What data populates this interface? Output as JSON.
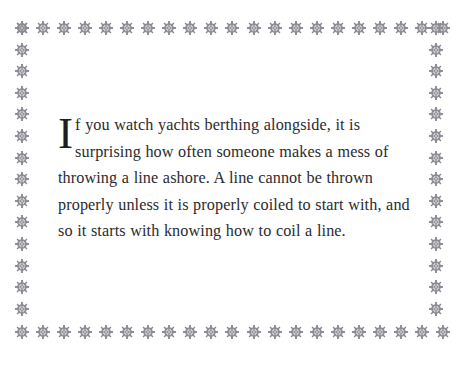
{
  "page": {
    "background_color": "#ffffff",
    "width": 464,
    "height": 372
  },
  "border": {
    "ornament_icon": "rosette-ornament-icon",
    "ornament_color": "#8b8b93",
    "top_row_count": 21,
    "bottom_row_count": 21,
    "left_column_count": 14,
    "right_column_count": 14
  },
  "body": {
    "dropcap": "I",
    "paragraph": "f you watch yachts berthing alongside, it is surprising how often someone makes a mess of throwing a line ashore. A line cannot be thrown properly unless it is properly coiled to start with, and so it starts with knowing how to coil a line.",
    "text_color": "#2b2b30",
    "lines": [
      "f you watch yachts berthing alongside, it is surprising",
      "how often someone makes a mess of throwing a",
      "line ashore. A line cannot be thrown properly unless",
      "it is properly coiled to start with, and so it starts with",
      "knowing how to coil a line."
    ]
  }
}
